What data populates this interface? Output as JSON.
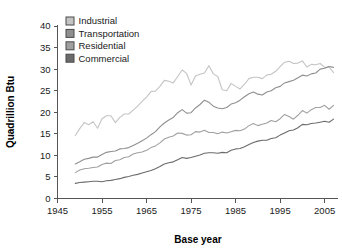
{
  "chart_data": {
    "type": "line",
    "title": "",
    "xlabel": "Base year",
    "ylabel": "Quadrillion Btu",
    "xlim": [
      1945,
      2008
    ],
    "ylim": [
      0,
      40
    ],
    "xticks": [
      1945,
      1955,
      1965,
      1975,
      1985,
      1995,
      2005
    ],
    "xtick_labels": [
      "1945",
      "1955",
      "1965",
      "1975",
      "1985",
      "1995",
      "2005"
    ],
    "yticks": [
      0,
      5,
      10,
      15,
      20,
      25,
      30,
      35,
      40
    ],
    "ytick_labels": [
      "0",
      "5",
      "10",
      "15",
      "20",
      "25",
      "30",
      "35",
      "40"
    ],
    "grid": false,
    "legend_position": "top-left-inside",
    "x": [
      1949,
      1950,
      1951,
      1952,
      1953,
      1954,
      1955,
      1956,
      1957,
      1958,
      1959,
      1960,
      1961,
      1962,
      1963,
      1964,
      1965,
      1966,
      1967,
      1968,
      1969,
      1970,
      1971,
      1972,
      1973,
      1974,
      1975,
      1976,
      1977,
      1978,
      1979,
      1980,
      1981,
      1982,
      1983,
      1984,
      1985,
      1986,
      1987,
      1988,
      1989,
      1990,
      1991,
      1992,
      1993,
      1994,
      1995,
      1996,
      1997,
      1998,
      1999,
      2000,
      2001,
      2002,
      2003,
      2004,
      2005,
      2006,
      2007
    ],
    "series": [
      {
        "name": "Industrial",
        "color": "#c4c4c4",
        "values": [
          14.6,
          16.2,
          17.6,
          17.1,
          17.8,
          16.3,
          18.5,
          19.2,
          19.2,
          17.6,
          18.8,
          19.6,
          19.6,
          20.5,
          21.4,
          22.5,
          23.5,
          24.8,
          24.9,
          26.0,
          27.4,
          27.2,
          26.8,
          28.3,
          29.8,
          29.0,
          26.3,
          28.4,
          28.8,
          29.1,
          30.8,
          28.9,
          28.3,
          25.2,
          25.0,
          26.7,
          26.0,
          25.4,
          26.5,
          27.8,
          28.1,
          28.1,
          27.8,
          28.6,
          28.8,
          29.5,
          30.6,
          31.6,
          31.8,
          31.3,
          31.4,
          31.9,
          30.5,
          31.1,
          31.0,
          31.3,
          30.4,
          30.5,
          29.2
        ]
      },
      {
        "name": "Transportation",
        "color": "#8f8f8f",
        "values": [
          8.0,
          8.5,
          9.1,
          9.3,
          9.6,
          9.6,
          10.2,
          10.7,
          10.9,
          11.0,
          11.5,
          11.6,
          11.8,
          12.3,
          12.8,
          13.4,
          14.0,
          14.8,
          15.5,
          16.6,
          17.5,
          18.2,
          18.8,
          19.9,
          20.6,
          19.8,
          19.9,
          21.0,
          21.8,
          22.8,
          22.3,
          21.4,
          21.0,
          20.8,
          21.1,
          21.9,
          22.2,
          22.8,
          23.6,
          24.3,
          24.7,
          24.2,
          24.0,
          24.7,
          25.0,
          25.7,
          26.0,
          26.8,
          27.1,
          27.4,
          28.0,
          28.6,
          28.4,
          28.9,
          29.1,
          30.0,
          30.2,
          30.6,
          30.4
        ]
      },
      {
        "name": "Residential",
        "color": "#a0a0a0",
        "values": [
          6.0,
          6.6,
          6.9,
          7.0,
          7.2,
          7.3,
          7.9,
          8.2,
          8.1,
          8.8,
          9.0,
          9.5,
          9.7,
          10.3,
          10.6,
          10.8,
          11.2,
          11.8,
          12.2,
          12.9,
          13.8,
          14.2,
          14.5,
          15.2,
          15.1,
          14.7,
          14.8,
          15.5,
          15.4,
          15.8,
          15.3,
          15.3,
          15.0,
          15.4,
          15.2,
          15.5,
          15.8,
          15.7,
          16.1,
          16.9,
          17.4,
          16.9,
          17.2,
          17.5,
          18.1,
          17.8,
          18.5,
          19.5,
          19.0,
          18.4,
          19.3,
          20.4,
          19.8,
          20.6,
          21.1,
          21.1,
          21.6,
          20.7,
          21.6
        ]
      },
      {
        "name": "Commercial",
        "color": "#6b6b6b",
        "values": [
          3.5,
          3.7,
          3.8,
          3.9,
          4.0,
          4.0,
          3.9,
          4.1,
          4.2,
          4.4,
          4.6,
          4.9,
          5.1,
          5.4,
          5.6,
          5.9,
          6.2,
          6.5,
          6.9,
          7.4,
          8.0,
          8.3,
          8.5,
          9.0,
          9.5,
          9.3,
          9.5,
          9.8,
          10.1,
          10.5,
          10.6,
          10.6,
          10.5,
          10.7,
          10.6,
          11.2,
          11.5,
          11.6,
          12.0,
          12.5,
          13.0,
          13.3,
          13.5,
          13.5,
          13.9,
          14.1,
          14.7,
          15.2,
          15.7,
          15.9,
          16.4,
          17.2,
          17.1,
          17.4,
          17.5,
          17.7,
          17.9,
          17.7,
          18.4
        ]
      }
    ],
    "legend": [
      {
        "label": "Industrial",
        "swatch": "#c4c4c4"
      },
      {
        "label": "Transportation",
        "swatch": "#8f8f8f"
      },
      {
        "label": "Residential",
        "swatch": "#a0a0a0"
      },
      {
        "label": "Commercial",
        "swatch": "#6b6b6b"
      }
    ]
  }
}
